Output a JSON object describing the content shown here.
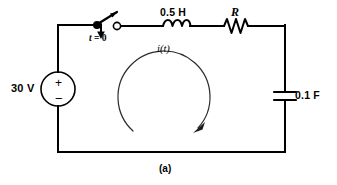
{
  "figure": {
    "caption": "(a)",
    "type": "electrical-circuit-schematic"
  },
  "components": {
    "voltage_source": {
      "label": "30 V",
      "symbol": "circle-source",
      "polarity_plus": "+",
      "polarity_minus": "−"
    },
    "switch": {
      "label_prefix": "t",
      "label_equals": "=",
      "label_value": "0",
      "label_full": "t = 0",
      "state": "open"
    },
    "inductor": {
      "label": "0.5 H",
      "value": 0.5,
      "unit": "H",
      "symbol": "coil"
    },
    "resistor": {
      "label": "R",
      "symbol": "zigzag"
    },
    "capacitor": {
      "label": "0.1 F",
      "value": 0.1,
      "unit": "F",
      "symbol": "parallel-plates"
    },
    "current_loop": {
      "label": "i(t)",
      "direction": "clockwise"
    }
  },
  "colors": {
    "wire": "#000000",
    "background": "#ffffff",
    "loop_arrow": "#2b2b2b"
  }
}
